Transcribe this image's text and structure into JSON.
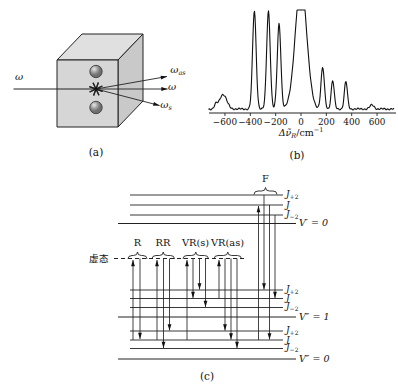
{
  "captions": {
    "a": "(a)",
    "b": "(b)",
    "c": "(c)"
  },
  "panel_a": {
    "incident": {
      "base": "ω",
      "sub": ""
    },
    "scattered": [
      {
        "base": "ω",
        "sub": "as"
      },
      {
        "base": "ω",
        "sub": ""
      },
      {
        "base": "ω",
        "sub": "s"
      }
    ]
  },
  "chart_data": {
    "type": "line",
    "xlabel_parts": {
      "main": "Δν̃",
      "sub": "R",
      "unit": "/cm",
      "exp": "−1"
    },
    "x_ticks": [
      -600,
      -400,
      -200,
      0,
      200,
      400,
      600
    ],
    "x_tick_labels": [
      "−600",
      "−400",
      "−200",
      "0",
      "200",
      "400",
      "600"
    ],
    "xlim": [
      -730,
      750
    ],
    "ylabel": "",
    "grid": false,
    "note": "central Rayleigh line clipped flat at plot top",
    "peaks": [
      {
        "shift_cm1": -672,
        "rel_height": 0.04,
        "sigma_cm1": 16
      },
      {
        "shift_cm1": -615,
        "rel_height": 0.15,
        "sigma_cm1": 40
      },
      {
        "shift_cm1": -368,
        "rel_height": 1.0,
        "sigma_cm1": 20
      },
      {
        "shift_cm1": -257,
        "rel_height": 1.0,
        "sigma_cm1": 20
      },
      {
        "shift_cm1": -173,
        "rel_height": 0.87,
        "sigma_cm1": 20
      },
      {
        "shift_cm1": 0,
        "rel_height": 1.3,
        "sigma_cm1": 63,
        "clipped": true
      },
      {
        "shift_cm1": 171,
        "rel_height": 0.42,
        "sigma_cm1": 19
      },
      {
        "shift_cm1": 250,
        "rel_height": 0.29,
        "sigma_cm1": 17
      },
      {
        "shift_cm1": 354,
        "rel_height": 0.28,
        "sigma_cm1": 17
      },
      {
        "shift_cm1": 560,
        "rel_height": 0.04,
        "sigma_cm1": 24
      }
    ]
  },
  "energy_diagram": {
    "virtual_label": "虚态",
    "virtual_level": {
      "y": 258.5,
      "x1": 114,
      "x2": 246
    },
    "levels": [
      {
        "y": 195,
        "x1": 130,
        "x2": 283,
        "main": "J",
        "sub": "+2"
      },
      {
        "y": 205,
        "x1": 130,
        "x2": 283,
        "main": "J",
        "sub": ""
      },
      {
        "y": 215,
        "x1": 130,
        "x2": 283,
        "main": "J",
        "sub": "−2"
      },
      {
        "y": 223.5,
        "x1": 118,
        "x2": 296,
        "main": "V′ = 0",
        "sub": "",
        "vib": true
      },
      {
        "y": 290,
        "x1": 130,
        "x2": 283,
        "main": "J",
        "sub": "+2"
      },
      {
        "y": 298.5,
        "x1": 130,
        "x2": 283,
        "main": "J",
        "sub": ""
      },
      {
        "y": 307.5,
        "x1": 130,
        "x2": 283,
        "main": "J",
        "sub": "−2"
      },
      {
        "y": 317,
        "x1": 118,
        "x2": 296,
        "main": "V″ = 1",
        "sub": "",
        "vib": true
      },
      {
        "y": 331,
        "x1": 130,
        "x2": 283,
        "main": "J",
        "sub": "+2"
      },
      {
        "y": 340,
        "x1": 130,
        "x2": 283,
        "main": "J",
        "sub": ""
      },
      {
        "y": 348.5,
        "x1": 130,
        "x2": 283,
        "main": "J",
        "sub": "−2"
      },
      {
        "y": 359,
        "x1": 118,
        "x2": 296,
        "main": "V″ = 0",
        "sub": "",
        "vib": true
      }
    ],
    "groups": [
      {
        "label": "R",
        "x1": 128,
        "x2": 147,
        "brace_y": 254.5,
        "label_x": 137.5,
        "label_y": 243
      },
      {
        "label": "RR",
        "x1": 152,
        "x2": 174.5,
        "brace_y": 254.5,
        "label_x": 163,
        "label_y": 243
      },
      {
        "label": "VR(s)",
        "x1": 183,
        "x2": 208.5,
        "brace_y": 254.5,
        "label_x": 195.5,
        "label_y": 243
      },
      {
        "label": "VR(as)",
        "x1": 214,
        "x2": 241.5,
        "brace_y": 254.5,
        "label_x": 227.5,
        "label_y": 243
      },
      {
        "label": "F",
        "x1": 254,
        "x2": 277,
        "brace_y": 190,
        "label_x": 265.5,
        "label_y": 179
      }
    ],
    "transitions": [
      {
        "x": 133,
        "from": 340,
        "to": 260,
        "dir": "up"
      },
      {
        "x": 140,
        "from": 258.5,
        "to": 339,
        "dir": "down"
      },
      {
        "x": 157,
        "from": 340,
        "to": 260,
        "dir": "up"
      },
      {
        "x": 163.5,
        "from": 258.5,
        "to": 348,
        "dir": "down"
      },
      {
        "x": 169.5,
        "from": 258.5,
        "to": 330.5,
        "dir": "down"
      },
      {
        "x": 187,
        "from": 340,
        "to": 260,
        "dir": "up"
      },
      {
        "x": 193,
        "from": 258.5,
        "to": 298,
        "dir": "down"
      },
      {
        "x": 199.5,
        "from": 258.5,
        "to": 289.5,
        "dir": "down"
      },
      {
        "x": 205.5,
        "from": 258.5,
        "to": 307,
        "dir": "down"
      },
      {
        "x": 219,
        "from": 298.5,
        "to": 260,
        "dir": "up"
      },
      {
        "x": 225,
        "from": 258.5,
        "to": 330.5,
        "dir": "down"
      },
      {
        "x": 231,
        "from": 258.5,
        "to": 339.5,
        "dir": "down"
      },
      {
        "x": 237,
        "from": 258.5,
        "to": 348,
        "dir": "down"
      },
      {
        "x": 258.5,
        "from": 340,
        "to": 206,
        "dir": "up"
      },
      {
        "x": 264,
        "from": 195,
        "to": 289.5,
        "dir": "down"
      },
      {
        "x": 269.5,
        "from": 205,
        "to": 339.5,
        "dir": "down"
      },
      {
        "x": 275,
        "from": 215,
        "to": 298,
        "dir": "down"
      }
    ]
  }
}
